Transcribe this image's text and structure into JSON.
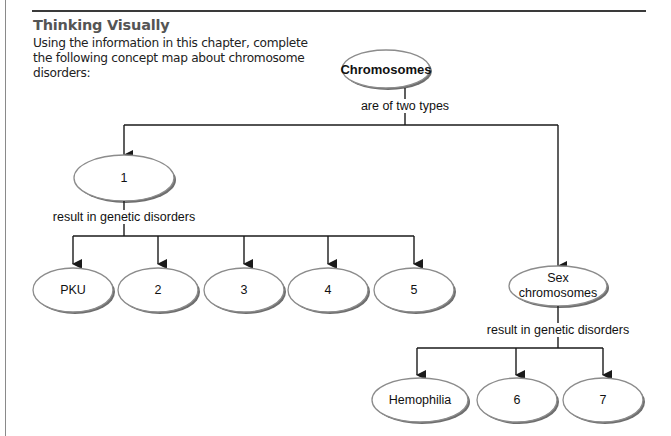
{
  "header": {
    "title": "Thinking Visually",
    "instructions": "Using the information in this chapter, complete the following concept map about chromosome disorders:"
  },
  "concept_map": {
    "root": {
      "label": "Chromosomes"
    },
    "root_link": "are of two types",
    "branch_left": {
      "label": "1",
      "link": "result in genetic disorders",
      "children": [
        {
          "label": "PKU"
        },
        {
          "label": "2"
        },
        {
          "label": "3"
        },
        {
          "label": "4"
        },
        {
          "label": "5"
        }
      ]
    },
    "branch_right": {
      "label_line1": "Sex",
      "label_line2": "chromosomes",
      "link": "result in genetic disorders",
      "children": [
        {
          "label": "Hemophilia"
        },
        {
          "label": "6"
        },
        {
          "label": "7"
        }
      ]
    }
  },
  "colors": {
    "line": "#1a1a1a",
    "ellipse_stroke": "#8c8c8c",
    "ellipse_shadow": "#7a7a7a",
    "title": "#555555"
  }
}
